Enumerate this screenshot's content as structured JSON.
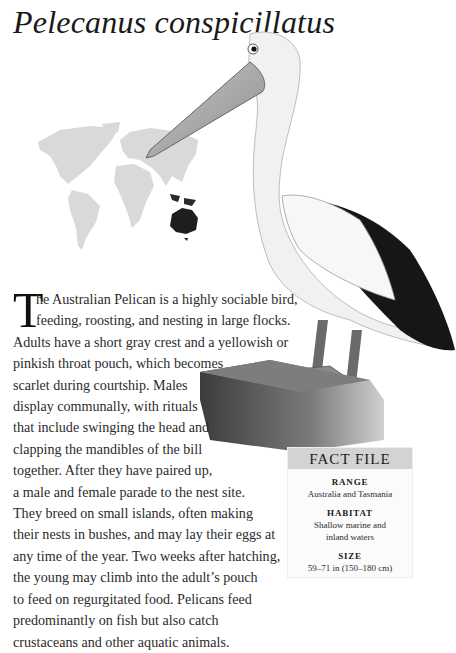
{
  "page": {
    "title": "Pelecanus conspicillatus"
  },
  "illustration": {
    "subject": "Australian Pelican on wooden post",
    "map": "world-map-range",
    "highlighted_region": "Australia and Tasmania",
    "colors": {
      "map_land": "#d9d9d9",
      "range_highlight": "#1e1e1e",
      "wing_black": "#151515",
      "post": "#5a5a5a"
    }
  },
  "article": {
    "drop_cap": "T",
    "lines": [
      "he Australian Pelican is a highly sociable bird,",
      "feeding, roosting, and nesting in large flocks.",
      "Adults have a short gray crest and a yellowish or",
      "pinkish throat pouch, which becomes",
      "scarlet during courtship. Males",
      "display communally, with rituals",
      "that include swinging the head and",
      "clapping the mandibles of the bill",
      "together. After they have paired up,",
      "a male and female parade to the nest site.",
      "They breed on small islands, often making",
      "their nests in bushes, and may lay their eggs at",
      "any time of the year. Two weeks after hatching,",
      "the young may climb into the adult’s pouch",
      "to feed on regurgitated food. Pelicans feed",
      "predominantly on fish but also catch",
      "crustaceans and other aquatic animals."
    ]
  },
  "fact_file": {
    "heading": "FACT FILE",
    "items": [
      {
        "label": "RANGE",
        "value": [
          "Australia and Tasmania"
        ]
      },
      {
        "label": "HABITAT",
        "value": [
          "Shallow marine and",
          "inland waters"
        ]
      },
      {
        "label": "SIZE",
        "value": [
          "59–71 in (150–180 cm)"
        ]
      }
    ],
    "colors": {
      "header_bg": "#d3d3d3",
      "body_bg": "#fbfbfb"
    }
  }
}
